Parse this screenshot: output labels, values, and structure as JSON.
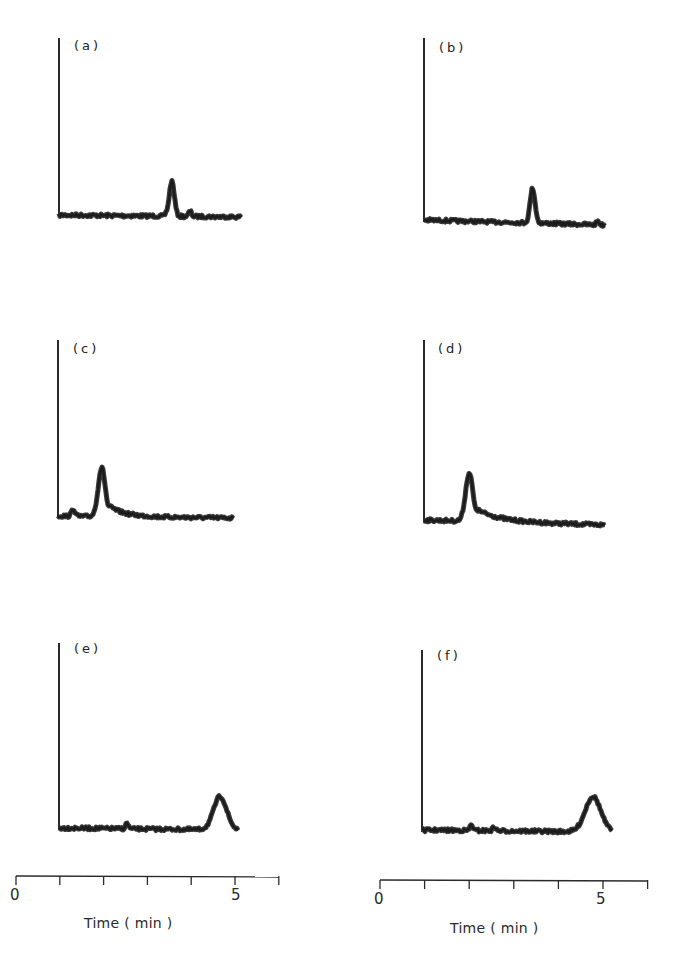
{
  "chart_data": {
    "type": "line",
    "title": "",
    "xlabel": "Time ( min )",
    "ylabel": "",
    "xlim": [
      0,
      6
    ],
    "x_ticks": [
      0,
      1,
      2,
      3,
      4,
      5,
      6
    ],
    "x_tick_labels": [
      "0",
      "5"
    ],
    "grid": false,
    "legend": null,
    "panels": [
      {
        "label": "(a)",
        "peak_time_min": 3.1,
        "peak_height_rel": 0.2,
        "peak_width_min": 0.15,
        "tail": 0.0,
        "baseline_end_min": 5.0,
        "minor_peaks": [
          {
            "t": 2.95,
            "h": 0.01
          },
          {
            "t": 3.6,
            "h": 0.03
          }
        ]
      },
      {
        "label": "(b)",
        "peak_time_min": 3.0,
        "peak_height_rel": 0.19,
        "peak_width_min": 0.15,
        "tail": 0.0,
        "baseline_end_min": 5.0,
        "minor_peaks": [
          {
            "t": 4.8,
            "h": 0.02
          }
        ]
      },
      {
        "label": "(c)",
        "peak_time_min": 1.0,
        "peak_height_rel": 0.27,
        "peak_width_min": 0.18,
        "tail": 0.35,
        "baseline_end_min": 4.0,
        "minor_peaks": [
          {
            "t": 0.35,
            "h": 0.04
          }
        ]
      },
      {
        "label": "(d)",
        "peak_time_min": 1.0,
        "peak_height_rel": 0.26,
        "peak_width_min": 0.18,
        "tail": 0.5,
        "baseline_end_min": 4.0,
        "minor_peaks": []
      },
      {
        "label": "(e)",
        "peak_time_min": 4.5,
        "peak_height_rel": 0.18,
        "peak_width_min": 0.4,
        "tail": 0.1,
        "baseline_end_min": 5.0,
        "minor_peaks": [
          {
            "t": 1.9,
            "h": 0.03
          }
        ]
      },
      {
        "label": "(f)",
        "peak_time_min": 4.5,
        "peak_height_rel": 0.19,
        "peak_width_min": 0.45,
        "tail": 0.1,
        "baseline_end_min": 5.0,
        "minor_peaks": [
          {
            "t": 1.3,
            "h": 0.03
          },
          {
            "t": 1.9,
            "h": 0.02
          }
        ]
      }
    ]
  },
  "panels": {
    "a": {
      "label": "(a)"
    },
    "b": {
      "label": "(b)"
    },
    "c": {
      "label": "(c)"
    },
    "d": {
      "label": "(d)"
    },
    "e": {
      "label": "(e)"
    },
    "f": {
      "label": "(f)"
    }
  },
  "axes": {
    "left": {
      "tick_start": "0",
      "tick_five": "5",
      "title": "Time ( min )"
    },
    "right": {
      "tick_start": "0",
      "tick_five": "5",
      "title": "Time ( min )"
    }
  },
  "colors": {
    "trace": "#1c1c1c",
    "axis": "#2a2a2a",
    "background": "#ffffff"
  }
}
